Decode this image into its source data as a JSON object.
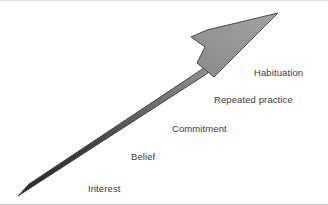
{
  "diagram": {
    "background_color": "#ffffff",
    "border_color": "#d9d9d9",
    "arrow": {
      "name": "upward-progression-arrow",
      "direction": "up-right",
      "shaft_gradient_start_color": "#2b2b2b",
      "shaft_gradient_end_color": "#9a9a9a",
      "head_fill_color": "#969696",
      "outline_color": "#4a4a4a",
      "tail_point": "18,190",
      "tip_point": "278,13"
    },
    "labels": [
      {
        "text": "Interest",
        "order": 1,
        "left": 88,
        "top": 184
      },
      {
        "text": "Belief",
        "order": 2,
        "left": 131,
        "top": 152
      },
      {
        "text": "Commitment",
        "order": 3,
        "left": 172,
        "top": 124
      },
      {
        "text": "Repeated practice",
        "order": 4,
        "left": 214,
        "top": 95
      },
      {
        "text": "Habituation",
        "order": 5,
        "left": 254,
        "top": 68
      }
    ]
  }
}
